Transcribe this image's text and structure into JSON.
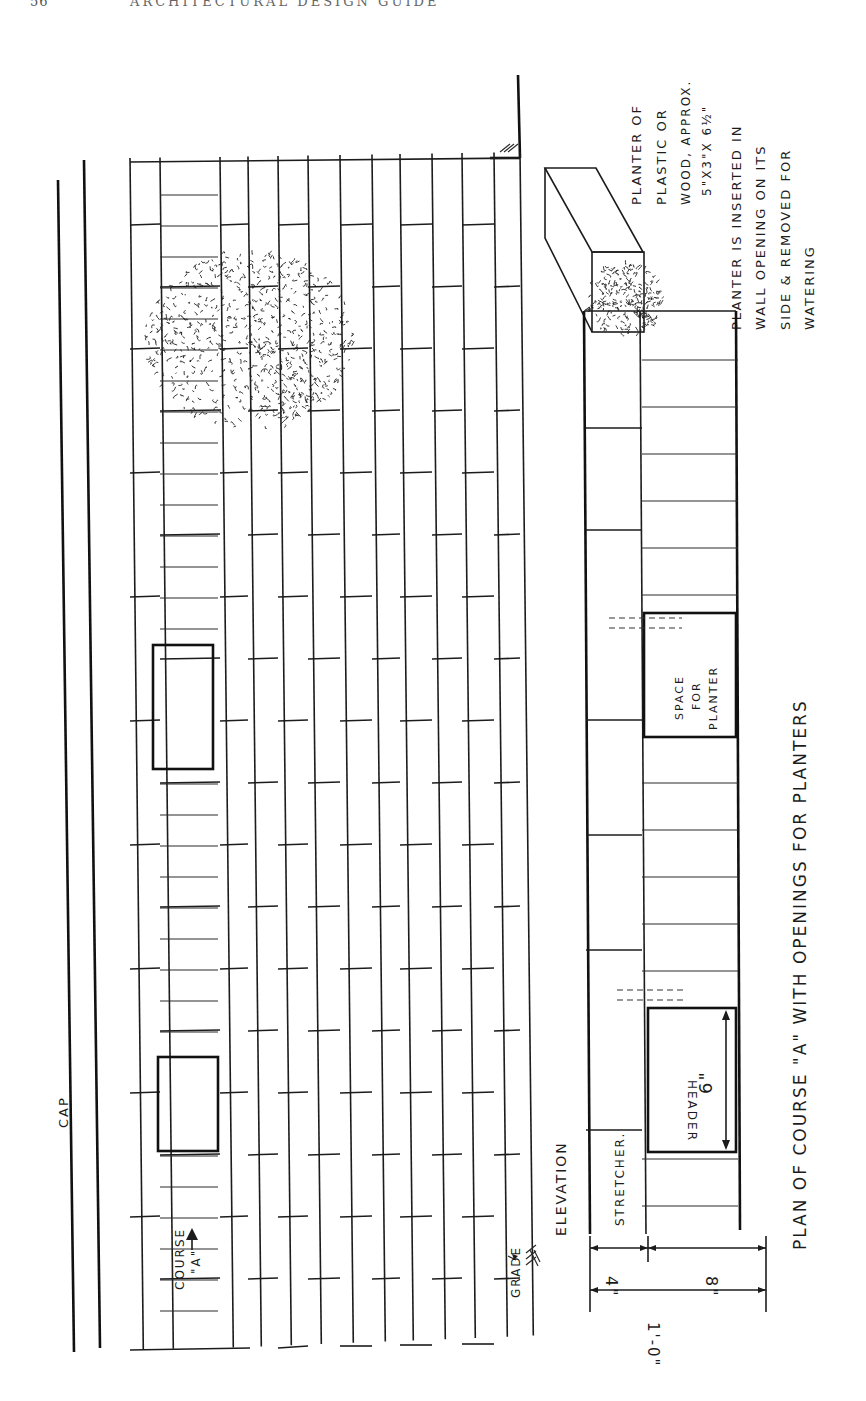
{
  "page": {
    "page_number": "56",
    "running_title": "ARCHITECTURAL DESIGN GUIDE",
    "background": "#ffffff",
    "ink": "#1c1c1c"
  },
  "drawing": {
    "orientation": "rotated 90 degrees",
    "elevation": {
      "label": "ELEVATION",
      "cap_label": "CAP",
      "grade_label": "GRADE",
      "course_label_line1": "COURSE",
      "course_label_line2": "\"A\""
    },
    "plan": {
      "title": "PLAN OF COURSE \"A\" WITH OPENINGS FOR PLANTERS",
      "stretcher_label": "STRETCHER.",
      "header_label": "HEADER",
      "space_label_1": "SPACE",
      "space_label_2": "FOR",
      "space_label_3": "PLANTER",
      "dim_opening": "6\"",
      "dim_stretcher": "4\"",
      "dim_header": "8\"",
      "dim_total": "1'-0\""
    },
    "planter_note": {
      "line1": "PLANTER OF",
      "line2": "PLASTIC OR",
      "line3": "WOOD, APPROX.",
      "line4": "5\"X3\"X 6½\""
    },
    "insert_note": {
      "line1": "PLANTER IS INSERTED IN",
      "line2": "WALL OPENING ON ITS",
      "line3": "SIDE & REMOVED FOR",
      "line4": "WATERING"
    }
  }
}
